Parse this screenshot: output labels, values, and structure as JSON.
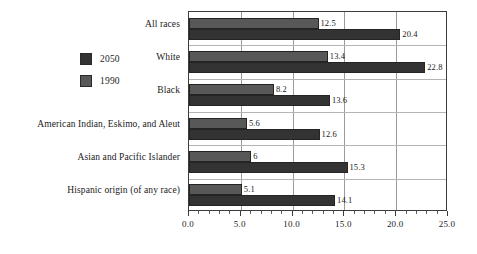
{
  "chart_data": {
    "type": "bar",
    "orientation": "horizontal",
    "title": "",
    "xlabel": "",
    "ylabel": "",
    "xlim": [
      0.0,
      25.0
    ],
    "grid": true,
    "legend_position": "left",
    "categories": [
      "All races",
      "White",
      "Black",
      "American Indian, Eskimo, and Aleut",
      "Asian and Pacific Islander",
      "Hispanic origin (of any race)"
    ],
    "series": [
      {
        "name": "1990",
        "color": "#585858",
        "values": [
          12.5,
          13.4,
          8.2,
          5.6,
          6,
          5.1
        ],
        "labels": [
          "12.5",
          "13.4",
          "8.2",
          "5.6",
          "6",
          "5.1"
        ]
      },
      {
        "name": "2050",
        "color": "#333333",
        "values": [
          20.4,
          22.8,
          13.6,
          12.6,
          15.3,
          14.1
        ],
        "labels": [
          "20.4",
          "22.8",
          "13.6",
          "12.6",
          "15.3",
          "14.1"
        ]
      }
    ],
    "xticks": [
      0.0,
      5.0,
      10.0,
      15.0,
      20.0,
      25.0
    ],
    "xticklabels": [
      "0.0",
      "5.0",
      "10.0",
      "15.0",
      "20.0",
      "25.0"
    ],
    "minor_ticks_per_interval": 5
  },
  "legend": {
    "entries": [
      {
        "label": "2050",
        "color": "#333333"
      },
      {
        "label": "1990",
        "color": "#585858"
      }
    ]
  },
  "axis": {
    "x_tick_labels": [
      "0.0",
      "5.0",
      "10.0",
      "15.0",
      "20.0",
      "25.0"
    ]
  },
  "categories": [
    "All races",
    "White",
    "Black",
    "American Indian, Eskimo, and Aleut",
    "Asian and Pacific Islander",
    "Hispanic origin (of any race)"
  ]
}
